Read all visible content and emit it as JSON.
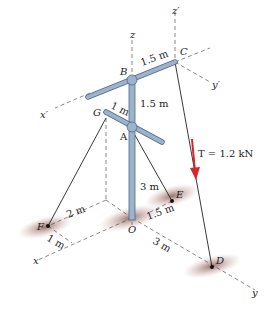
{
  "diagram": {
    "points": {
      "O": "O",
      "A": "A",
      "B": "B",
      "C": "C",
      "D": "D",
      "E": "E",
      "F": "F",
      "G": "G"
    },
    "axes": {
      "x": "x",
      "y": "y",
      "z": "z",
      "x_prime": "x′",
      "y_prime": "y′",
      "z_prime": "z′"
    },
    "dimensions": {
      "BC": "1.5 m",
      "AB": "1.5 m",
      "GA": "1 m",
      "OA": "3 m",
      "F_x": "2 m",
      "F_offset": "1 m",
      "E_offset": "1.5 m",
      "OD": "3 m"
    },
    "force": {
      "label": "T = 1.2 kN",
      "color": "#d8262b"
    },
    "colors": {
      "pole": "#9db3cc",
      "pole_outline": "#4d6a8a",
      "shadow": "#a07a74",
      "line": "#222222"
    }
  }
}
